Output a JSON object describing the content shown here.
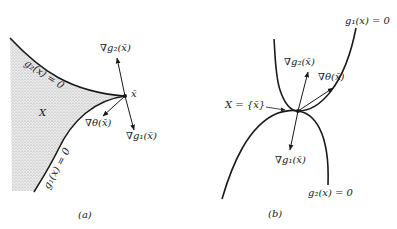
{
  "panel_a": {
    "caption": "(a)",
    "labels": {
      "g2_curve": "g₂(x) = 0",
      "g1_curve": "g₁(x) = 0",
      "region": "X",
      "point": "x̄",
      "grad_g2": "∇g₂(x̄)",
      "grad_g1": "∇g₁(x̄)",
      "grad_theta": "∇θ(x̄)"
    }
  },
  "panel_b": {
    "caption": "(b)",
    "labels": {
      "g1_curve": "g₁(x) = 0",
      "g2_curve": "g₂(x) = 0",
      "feasible_set": "X = {x̄}",
      "grad_g2": "∇g₂(x̄)",
      "grad_theta": "∇θ(x̄)",
      "grad_g1": "∇g₁(x̄)"
    }
  },
  "colors": {
    "line": "#1a1a1a",
    "region_fill": "#d8d8d8",
    "background": "#ffffff"
  }
}
